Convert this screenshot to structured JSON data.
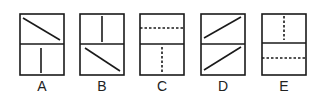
{
  "figures": [
    {
      "label": "A",
      "x": 20,
      "top": "diagonal-down",
      "bottom": "vertical-solid"
    },
    {
      "label": "B",
      "x": 80,
      "top": "vertical-solid",
      "bottom": "diagonal-down"
    },
    {
      "label": "C",
      "x": 140,
      "top": "horizontal-dashed",
      "bottom": "vertical-dashed"
    },
    {
      "label": "D",
      "x": 201,
      "top": "diagonal-up",
      "bottom": "diagonal-up"
    },
    {
      "label": "E",
      "x": 262,
      "top": "vertical-dashed",
      "bottom": "horizontal-dashed"
    }
  ],
  "colors": {
    "stroke": "#1a1a1a",
    "background": "#ffffff"
  }
}
